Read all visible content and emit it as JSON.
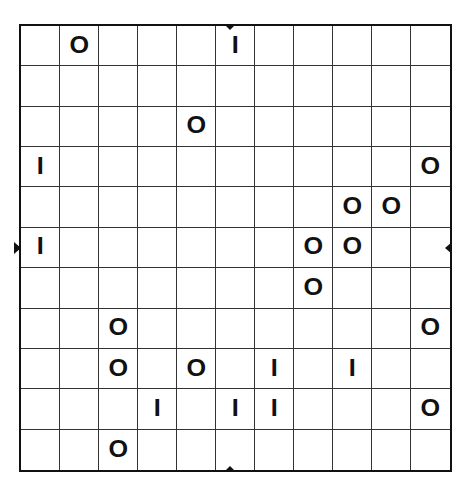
{
  "puzzle": {
    "type": "binary-grid",
    "rows": 11,
    "cols": 11,
    "symbols": {
      "zero": "O",
      "one": "I"
    },
    "colors": {
      "line": "#333333",
      "border": "#111111",
      "glyph": "#111111",
      "background": "#ffffff"
    },
    "grid": [
      [
        "",
        "O",
        "",
        "",
        "",
        "I",
        "",
        "",
        "",
        "",
        ""
      ],
      [
        "",
        "",
        "",
        "",
        "",
        "",
        "",
        "",
        "",
        "",
        ""
      ],
      [
        "",
        "",
        "",
        "",
        "O",
        "",
        "",
        "",
        "",
        "",
        ""
      ],
      [
        "I",
        "",
        "",
        "",
        "",
        "",
        "",
        "",
        "",
        "",
        "O"
      ],
      [
        "",
        "",
        "",
        "",
        "",
        "",
        "",
        "",
        "O",
        "O",
        ""
      ],
      [
        "I",
        "",
        "",
        "",
        "",
        "",
        "",
        "O",
        "O",
        "",
        ""
      ],
      [
        "",
        "",
        "",
        "",
        "",
        "",
        "",
        "O",
        "",
        "",
        ""
      ],
      [
        "",
        "",
        "O",
        "",
        "",
        "",
        "",
        "",
        "",
        "",
        "O"
      ],
      [
        "",
        "",
        "O",
        "",
        "O",
        "",
        "I",
        "",
        "I",
        "",
        ""
      ],
      [
        "",
        "",
        "",
        "I",
        "",
        "I",
        "I",
        "",
        "",
        "",
        "O"
      ],
      [
        "",
        "",
        "O",
        "",
        "",
        "",
        "",
        "",
        "",
        "",
        ""
      ]
    ],
    "edge_markers": [
      {
        "side": "top",
        "position": "center",
        "icon": "triangle-down-icon"
      },
      {
        "side": "bottom",
        "position": "center",
        "icon": "triangle-up-icon"
      },
      {
        "side": "left",
        "position": "row-6",
        "icon": "triangle-right-icon"
      },
      {
        "side": "right",
        "position": "row-6",
        "icon": "triangle-left-icon"
      }
    ]
  }
}
